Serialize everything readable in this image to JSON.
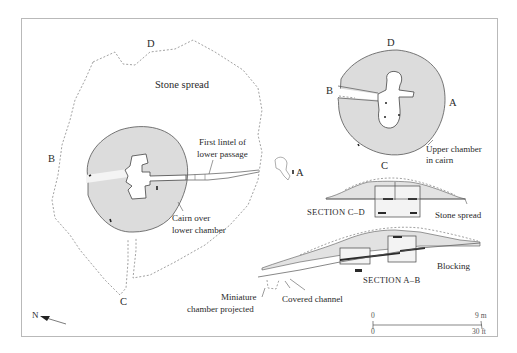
{
  "figure": {
    "colors": {
      "frame": "#b9b9b9",
      "cairn_fill": "#dcdcdc",
      "ink": "#2a2a2a",
      "dashed_outline": "#8a8a8a"
    }
  },
  "lower_plan": {
    "stone_spread_label": "Stone spread",
    "point_labels": {
      "D": "D",
      "B": "B",
      "C": "C",
      "A": "A"
    },
    "annotations": {
      "first_lintel_line1": "First lintel of",
      "first_lintel_line2": "lower passage",
      "cairn_line1": "Cairn over",
      "cairn_line2": "lower chamber",
      "miniature_line1": "Miniature",
      "miniature_line2": "chamber projected"
    }
  },
  "upper_plan": {
    "point_labels": {
      "D": "D",
      "B": "B",
      "A": "A",
      "C": "C"
    },
    "annotations": {
      "upper_line1": "Upper chamber",
      "upper_line2": "in cairn"
    }
  },
  "section_cd": {
    "caption": "SECTION C–D",
    "annotation": "Stone spread"
  },
  "section_ab": {
    "caption": "SECTION A–B",
    "annotation_blocking": "Blocking",
    "annotation_channel": "Covered channel"
  },
  "north_arrow": {
    "label": "N",
    "icon": "north-arrow-icon"
  },
  "scale_bar": {
    "metric_start": "0",
    "metric_end": "9 m",
    "imperial_start": "0",
    "imperial_end": "30 ft"
  }
}
